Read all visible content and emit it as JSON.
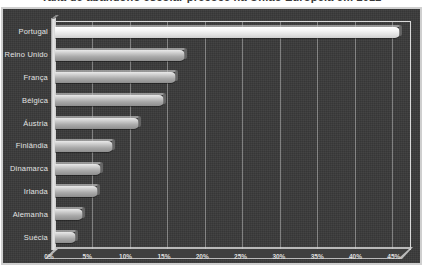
{
  "title": "Taxa de abandono escolar precoce na União Europeia em 2012",
  "chart_data": {
    "type": "bar",
    "orientation": "horizontal",
    "title": "Taxa de abandono escolar precoce na União Europeia em 2012",
    "xlabel": "",
    "ylabel": "",
    "categories": [
      "Portugal",
      "Reino Unido",
      "França",
      "Bélgica",
      "Áustria",
      "Finlândia",
      "Dinamarca",
      "Irlanda",
      "Alemanha",
      "Suécia"
    ],
    "values": [
      46.0,
      17.3,
      16.1,
      14.6,
      11.2,
      7.8,
      6.1,
      5.7,
      3.8,
      2.8
    ],
    "highlight_index": 0,
    "xlim": [
      0,
      47.5
    ],
    "xticks": [
      0,
      5,
      10,
      15,
      20,
      25,
      30,
      35,
      40,
      45
    ],
    "xtick_labels": [
      "0%",
      "5%",
      "10%",
      "15%",
      "20%",
      "25%",
      "30%",
      "35%",
      "40%",
      "45%"
    ],
    "grid": true,
    "legend": false,
    "style_3d": true,
    "colors": {
      "background": "#3a3a3a",
      "frame": "#cfcfcf",
      "bar": "#c8c8c8",
      "bar_highlight": "#f2f2f2",
      "text": "#e3e3e3",
      "gridline": "#d7d7d7"
    }
  }
}
